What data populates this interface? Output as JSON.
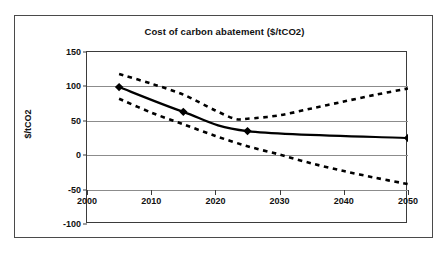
{
  "chart_data": {
    "type": "line",
    "title": "Cost of carbon abatement ($/tCO2)",
    "xlabel": "",
    "ylabel": "$/tCO2",
    "xlim": [
      2000,
      2050
    ],
    "ylim": [
      -100,
      150
    ],
    "xticks": [
      2000,
      2010,
      2020,
      2030,
      2040,
      2050
    ],
    "yticks": [
      150,
      100,
      50,
      0,
      -50,
      -100
    ],
    "xtick_labels": [
      "2000",
      "2010",
      "2020",
      "2030",
      "2040",
      "2050"
    ],
    "ytick_labels": [
      "150",
      "100",
      "50",
      "0",
      "-50",
      "-100"
    ],
    "grid": "horizontal",
    "legend": "none",
    "axis_crossing_y": -50,
    "series": [
      {
        "name": "central-estimate",
        "style": "solid",
        "marker": "diamond",
        "x": [
          2005,
          2015,
          2025,
          2050
        ],
        "values": [
          99,
          63,
          35,
          25
        ]
      },
      {
        "name": "upper-bound",
        "style": "dashed",
        "marker": "none",
        "x": [
          2005,
          2010,
          2015,
          2020,
          2023,
          2025,
          2030,
          2035,
          2040,
          2045,
          2050
        ],
        "values": [
          118,
          104,
          88,
          65,
          53,
          53,
          58,
          68,
          78,
          88,
          97
        ]
      },
      {
        "name": "lower-bound",
        "style": "dashed",
        "marker": "none",
        "x": [
          2005,
          2010,
          2015,
          2020,
          2025,
          2030,
          2035,
          2040,
          2045,
          2050
        ],
        "values": [
          82,
          62,
          45,
          28,
          13,
          1,
          -12,
          -23,
          -33,
          -42
        ]
      }
    ]
  },
  "colors": {
    "frame": "#4a4a4a",
    "axis": "#3b3b3b",
    "gridline": "#8c8c8c",
    "series_line": "#000000",
    "background": "#ffffff"
  }
}
